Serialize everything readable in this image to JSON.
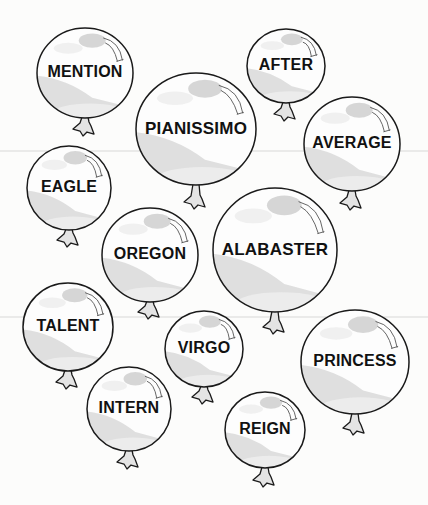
{
  "worksheet": {
    "title": "Word balloons",
    "colors": {
      "background": "#fcfcfb",
      "outline": "#1a1a1a",
      "balloon_fill": "#fdfdfd",
      "shade": "#d4d4d4",
      "highlight": "#cfcfcf",
      "text": "#111111"
    },
    "balloons": [
      {
        "word": "MENTION",
        "cx": 85,
        "cy": 73,
        "rx": 48,
        "ry": 45,
        "knot_y": 127,
        "font": 16
      },
      {
        "word": "AFTER",
        "cx": 286,
        "cy": 66,
        "rx": 39,
        "ry": 37,
        "knot_y": 112,
        "font": 16
      },
      {
        "word": "PIANISSIMO",
        "cx": 196,
        "cy": 129,
        "rx": 60,
        "ry": 56,
        "knot_y": 200,
        "font": 17
      },
      {
        "word": "AVERAGE",
        "cx": 352,
        "cy": 144,
        "rx": 48,
        "ry": 47,
        "knot_y": 201,
        "font": 16
      },
      {
        "word": "EAGLE",
        "cx": 69,
        "cy": 188,
        "rx": 42,
        "ry": 42,
        "knot_y": 238,
        "font": 16
      },
      {
        "word": "OREGON",
        "cx": 150,
        "cy": 255,
        "rx": 48,
        "ry": 47,
        "knot_y": 310,
        "font": 16
      },
      {
        "word": "ALABASTER",
        "cx": 275,
        "cy": 250,
        "rx": 62,
        "ry": 62,
        "knot_y": 325,
        "font": 17
      },
      {
        "word": "TALENT",
        "cx": 68,
        "cy": 327,
        "rx": 45,
        "ry": 44,
        "knot_y": 380,
        "font": 16
      },
      {
        "word": "VIRGO",
        "cx": 204,
        "cy": 349,
        "rx": 39,
        "ry": 38,
        "knot_y": 395,
        "font": 16
      },
      {
        "word": "PRINCESS",
        "cx": 355,
        "cy": 362,
        "rx": 54,
        "ry": 52,
        "knot_y": 426,
        "font": 16
      },
      {
        "word": "INTERN",
        "cx": 129,
        "cy": 409,
        "rx": 42,
        "ry": 42,
        "knot_y": 460,
        "font": 16
      },
      {
        "word": "REIGN",
        "cx": 265,
        "cy": 430,
        "rx": 40,
        "ry": 38,
        "knot_y": 478,
        "font": 16
      }
    ]
  }
}
